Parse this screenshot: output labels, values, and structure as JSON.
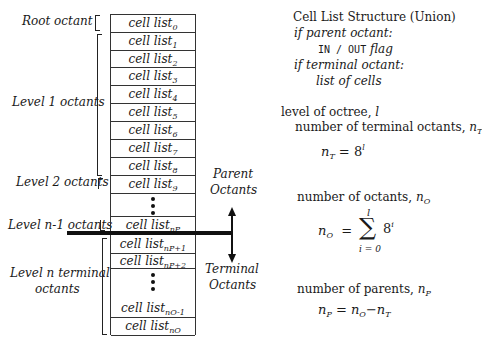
{
  "table": {
    "rows": [
      {
        "base": "cell list",
        "sub": "0"
      },
      {
        "base": "cell list",
        "sub": "1"
      },
      {
        "base": "cell list",
        "sub": "2"
      },
      {
        "base": "cell list",
        "sub": "3"
      },
      {
        "base": "cell list",
        "sub": "4"
      },
      {
        "base": "cell list",
        "sub": "5"
      },
      {
        "base": "cell list",
        "sub": "6"
      },
      {
        "base": "cell list",
        "sub": "7"
      },
      {
        "base": "cell list",
        "sub": "8"
      },
      {
        "base": "cell list",
        "sub": "9"
      },
      {
        "base": "cell list",
        "sub": "nP"
      },
      {
        "base": "cell list",
        "sub": "nP+1"
      },
      {
        "base": "cell list",
        "sub": "nP+2"
      },
      {
        "base": "cell list",
        "sub": "nO-1"
      },
      {
        "base": "cell list",
        "sub": "nO"
      }
    ]
  },
  "left_labels": {
    "root": "Root octant",
    "level1": "Level 1 octants",
    "level2": "Level 2 octants",
    "level_n1": "Level n-1 octants",
    "level_n_line1": "Level n terminal",
    "level_n_line2": "octants"
  },
  "arrow_labels": {
    "parent_line1": "Parent",
    "parent_line2": "Octants",
    "terminal_line1": "Terminal",
    "terminal_line2": "Octants"
  },
  "right_panel": {
    "title": "Cell List Structure (Union)",
    "if_parent": "if parent octant:",
    "flag_mono": "IN / OUT",
    "flag_word": "flag",
    "if_terminal": "if terminal octant:",
    "list_of_cells": "list of cells",
    "level_label": "level of octree,",
    "level_var": "l",
    "num_terminal_label": "number of terminal octants,",
    "nT_var": "n",
    "nT_sub": "T",
    "eq1_lhs": "n",
    "eq1_lhs_sub": "T",
    "eq1_eq": "=",
    "eq1_base": "8",
    "eq1_exp": "l",
    "num_octants_label": "number of octants,",
    "nO_var": "n",
    "nO_sub": "O",
    "eq2_lhs": "n",
    "eq2_lhs_sub": "O",
    "eq2_eq": "=",
    "eq2_sigma": "∑",
    "eq2_upper": "l",
    "eq2_lower": "i = 0",
    "eq2_base": "8",
    "eq2_exp": "i",
    "num_parents_label": "number of parents,",
    "nP_var": "n",
    "nP_sub": "P",
    "eq3_lhs": "n",
    "eq3_lhs_sub": "P",
    "eq3_eq": "=",
    "eq3_a": "n",
    "eq3_a_sub": "O",
    "eq3_minus": "−",
    "eq3_b": "n",
    "eq3_b_sub": "T"
  }
}
